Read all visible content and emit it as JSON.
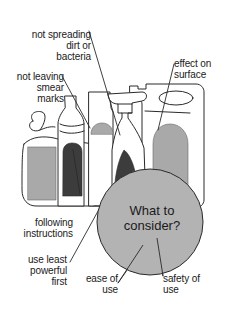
{
  "diagram": {
    "center": "What to\nconsider?",
    "labels": {
      "not_spreading": "not spreading\ndirt or\nbacteria",
      "not_leaving": "not leaving\nsmear\nmarks",
      "effect_surface": "effect on\nsurface",
      "following": "following\ninstructions",
      "least_powerful": "use least\npowerful\nfirst",
      "ease": "ease of\nuse",
      "safety": "safety of\nuse"
    },
    "illustration": "cleaning-product-bottles",
    "colors": {
      "outline": "#2a2a2a",
      "light_fill": "#a9a9a9",
      "dark_fill": "#3c3c3c",
      "circle_fill": "#b3b3b3",
      "background": "#ffffff"
    }
  }
}
